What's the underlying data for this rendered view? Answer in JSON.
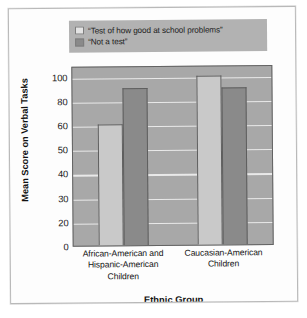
{
  "chart_data": {
    "type": "bar",
    "title": "",
    "xlabel": "Ethnic Group",
    "ylabel": "Mean Score on Verbal Tasks",
    "grid": true,
    "legend_position": "top",
    "yticks": [
      100,
      80,
      60,
      50,
      40,
      30,
      20,
      0
    ],
    "ytick_labels": [
      "100",
      "80",
      "60",
      "50",
      "40",
      "30",
      "20",
      "0"
    ],
    "ylim": [
      0,
      108
    ],
    "axis_note": "ticks evenly spaced although values are non-linear",
    "categories": [
      "African-American and Hispanic-American Children",
      "Caucasian-American Children"
    ],
    "series": [
      {
        "name": "“Test of how good at school problems”",
        "color": "#c9c9c9",
        "values": [
          60,
          100
        ]
      },
      {
        "name": "“Not a test”",
        "color": "#8a8a8a",
        "values": [
          90,
          90
        ]
      }
    ]
  },
  "legend": {
    "items": [
      {
        "swatch": "light-swatch",
        "label": "“Test of how good at school problems”"
      },
      {
        "swatch": "dark-swatch",
        "label": "“Not a test”"
      }
    ]
  },
  "axes": {
    "y_title": "Mean Score on Verbal Tasks",
    "x_title": "Ethnic Group",
    "y_ticks": [
      "100",
      "80",
      "60",
      "50",
      "40",
      "30",
      "20",
      "0"
    ],
    "x_categories": [
      {
        "line1": "African-American and",
        "line2": "Hispanic-American",
        "line3": "Children"
      },
      {
        "line1": "Caucasian-American",
        "line2": "Children",
        "line3": ""
      }
    ]
  },
  "colors": {
    "plot_background": "#a8a8a8",
    "gridline": "#efefef",
    "bar_light": "#c9c9c9",
    "bar_dark": "#8a8a8a",
    "legend_background": "#b2b2b2",
    "page_background": "#ffffff"
  }
}
